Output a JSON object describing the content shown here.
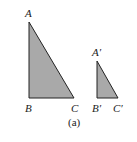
{
  "figure": {
    "caption": "(a)",
    "fill_color": "#a9a9a9",
    "stroke_color": "#222222",
    "triangles": [
      {
        "name": "large",
        "labels": {
          "top": "A",
          "bottom_left": "B",
          "bottom_right": "C"
        }
      },
      {
        "name": "small",
        "labels": {
          "top": "A′",
          "bottom_left": "B′",
          "bottom_right": "C′"
        }
      }
    ]
  }
}
